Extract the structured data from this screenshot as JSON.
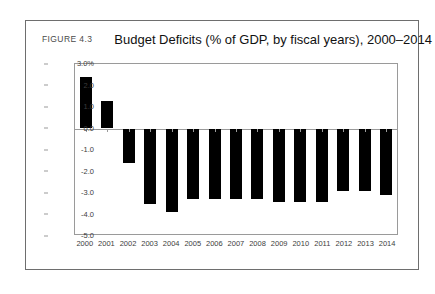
{
  "figure": {
    "label": "FIGURE 4.3",
    "title": "Budget Deficits (% of GDP, by fiscal years), 2000–2014",
    "source": "Source: U.S. Treasury, CSFB"
  },
  "chart_data": {
    "type": "bar",
    "title": "Budget Deficits (% of GDP, by fiscal years), 2000–2014",
    "xlabel": "",
    "ylabel": "",
    "ylim": [
      -5.0,
      3.0
    ],
    "ytick_values": [
      3.0,
      2.0,
      1.0,
      0.0,
      -1.0,
      -2.0,
      -3.0,
      -4.0,
      -5.0
    ],
    "ytick_labels": [
      "3.0%",
      "2.0",
      "1.0",
      "0.0",
      "-1.0",
      "-2.0",
      "-3.0",
      "-4.0",
      "-5.0"
    ],
    "grid": false,
    "legend": null,
    "bar_color": "#000000",
    "categories": [
      "2000",
      "2001",
      "2002",
      "2003",
      "2004",
      "2005",
      "2006",
      "2007",
      "2008",
      "2009",
      "2010",
      "2011",
      "2012",
      "2013",
      "2014"
    ],
    "values": [
      2.4,
      1.3,
      -1.6,
      -3.5,
      -3.9,
      -3.3,
      -3.3,
      -3.3,
      -3.3,
      -3.4,
      -3.4,
      -3.4,
      -2.9,
      -2.9,
      -3.1
    ]
  }
}
